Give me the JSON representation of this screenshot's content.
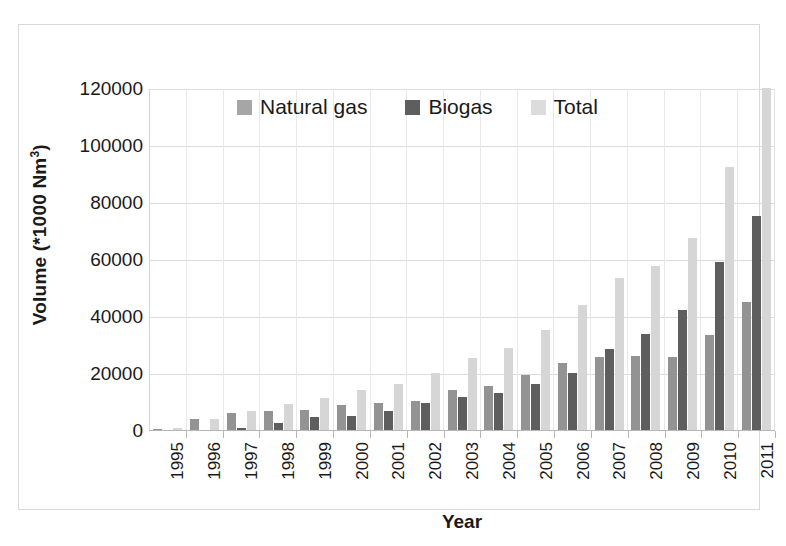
{
  "chart_data": {
    "type": "bar",
    "title": "",
    "xlabel": "Year",
    "ylabel": "Volume (*1000 Nm³)",
    "ylabel_base": "Volume (*1000 Nm",
    "ylabel_sup": "3",
    "ylabel_tail": ")",
    "categories": [
      "1995",
      "1996",
      "1997",
      "1998",
      "1999",
      "2000",
      "2001",
      "2002",
      "2003",
      "2004",
      "2005",
      "2006",
      "2007",
      "2008",
      "2009",
      "2010",
      "2011"
    ],
    "series": [
      {
        "name": "Natural gas",
        "color": "#939393",
        "values": [
          400,
          3900,
          6000,
          6600,
          6900,
          8900,
          9500,
          10300,
          13900,
          15600,
          19300,
          23500,
          25700,
          25900,
          25700,
          33500,
          45000
        ]
      },
      {
        "name": "Biogas",
        "color": "#5e5e5e",
        "values": [
          0,
          0,
          600,
          2500,
          4400,
          5000,
          6500,
          9500,
          11500,
          13000,
          16000,
          20000,
          28300,
          33800,
          42000,
          58800,
          75000
        ]
      },
      {
        "name": "Total",
        "color": "#d6d6d6",
        "values": [
          600,
          4000,
          6600,
          9300,
          11400,
          14000,
          16200,
          19900,
          25400,
          28700,
          35000,
          43700,
          53300,
          57700,
          67500,
          92300,
          120000
        ]
      }
    ],
    "ylim": [
      0,
      120000
    ],
    "y_ticks": [
      0,
      20000,
      40000,
      60000,
      80000,
      100000,
      120000
    ],
    "y_tick_labels": [
      "0",
      "20000",
      "40000",
      "60000",
      "80000",
      "100000",
      "120000"
    ],
    "grid": true,
    "legend_position": "top-center-inside",
    "legend": [
      "Natural gas",
      "Biogas",
      "Total"
    ]
  }
}
